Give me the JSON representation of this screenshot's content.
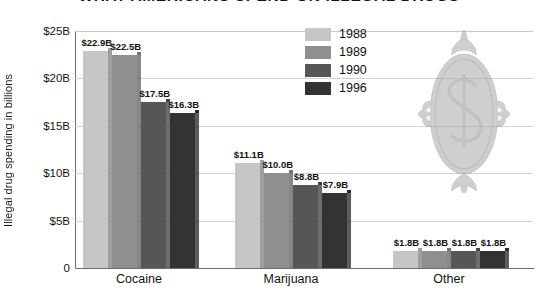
{
  "chart_data": {
    "type": "bar",
    "title": "WHAT AMERICANS SPEND ON ILLEGAL DRUGS",
    "xlabel": "",
    "ylabel": "Illegal drug spending in billions",
    "categories": [
      "Cocaine",
      "Marijuana",
      "Other"
    ],
    "series": [
      {
        "name": "1988",
        "color": "#c6c6c6",
        "values": [
          22.9,
          11.1,
          1.8
        ],
        "labels": [
          "$22.9B",
          "$11.1B",
          "$1.8B"
        ]
      },
      {
        "name": "1989",
        "color": "#8f8f8f",
        "values": [
          22.5,
          10.0,
          1.8
        ],
        "labels": [
          "$22.5B",
          "$10.0B",
          "$1.8B"
        ]
      },
      {
        "name": "1990",
        "color": "#565656",
        "values": [
          17.5,
          8.8,
          1.8
        ],
        "labels": [
          "$17.5B",
          "$8.8B",
          "$1.8B"
        ]
      },
      {
        "name": "1996",
        "color": "#333333",
        "values": [
          16.3,
          7.9,
          1.8
        ],
        "labels": [
          "$16.3B",
          "$7.9B",
          "$1.8B"
        ]
      }
    ],
    "ylim": [
      0,
      25
    ],
    "yticks": [
      {
        "value": 25,
        "label": "$25B"
      },
      {
        "value": 20,
        "label": "$20B"
      },
      {
        "value": 15,
        "label": "$15B"
      },
      {
        "value": 10,
        "label": "$10B"
      },
      {
        "value": 5,
        "label": "$5B"
      },
      {
        "value": 0,
        "label": "0"
      }
    ],
    "grid": true,
    "legend_position": "top-center-right",
    "ornament": "ornamental-dollar-sign-medallion"
  },
  "colors": {
    "axis": "#6d6d6d",
    "gridline": "#d2d2d2",
    "text": "#111111",
    "ornament": "#a8a8a8",
    "background": "#ffffff"
  }
}
